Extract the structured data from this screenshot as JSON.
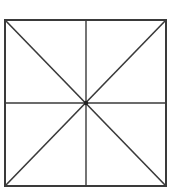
{
  "diagram": {
    "stroke_color": "#3a3a3a",
    "square": {
      "x1": 5,
      "y1": 20,
      "x2": 166,
      "y2": 186
    },
    "center": {
      "x": 86,
      "y": 103
    },
    "lines": [
      {
        "name": "diagonal-tl-br",
        "x1": 5,
        "y1": 20,
        "x2": 166,
        "y2": 186
      },
      {
        "name": "diagonal-tr-bl",
        "x1": 166,
        "y1": 20,
        "x2": 5,
        "y2": 186
      },
      {
        "name": "vertical-midline",
        "x1": 86,
        "y1": 20,
        "x2": 86,
        "y2": 186
      },
      {
        "name": "horizontal-midline",
        "x1": 5,
        "y1": 103,
        "x2": 166,
        "y2": 103
      }
    ]
  }
}
